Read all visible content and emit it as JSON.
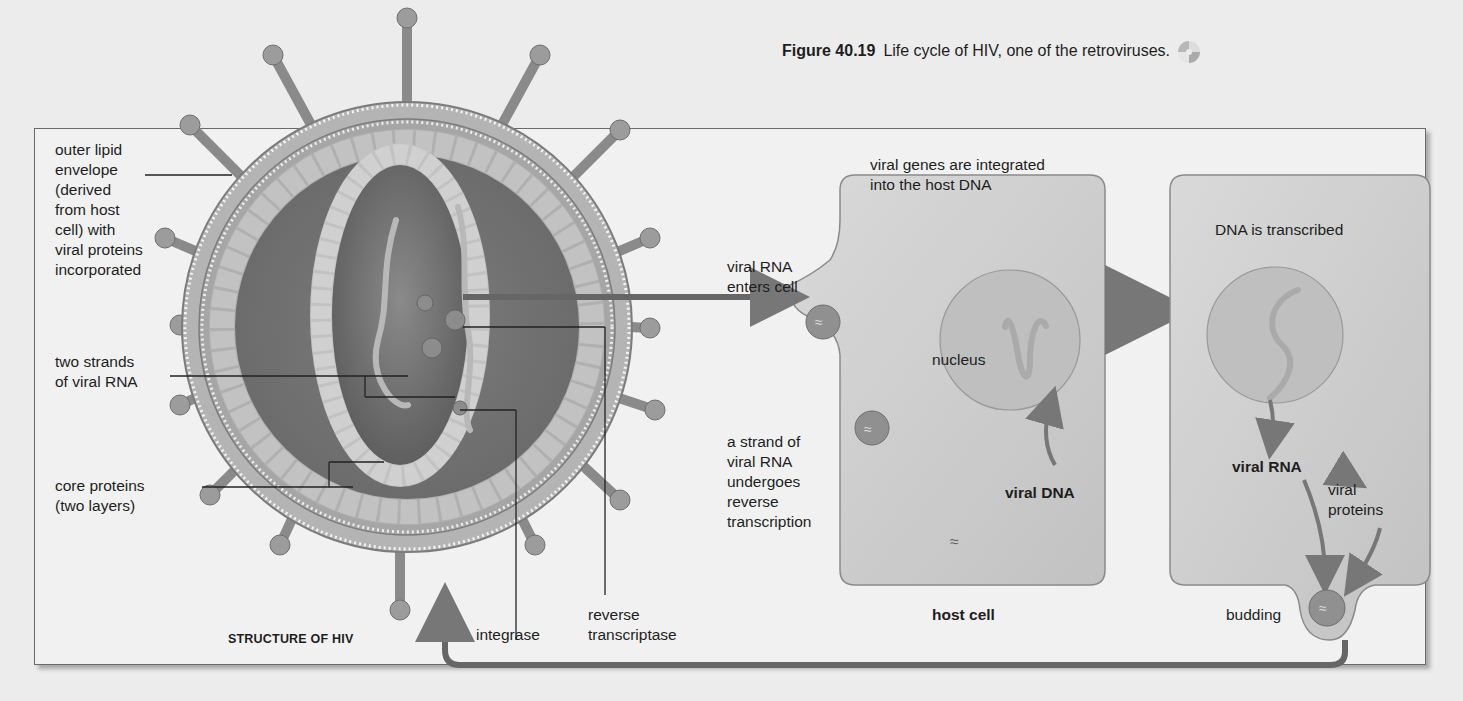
{
  "caption": {
    "figure_number": "Figure 40.19",
    "text": "Life cycle of HIV, one of the retroviruses.",
    "icon": "cd-disc-icon"
  },
  "structure": {
    "title": "STRUCTURE OF HIV",
    "labels": {
      "envelope": [
        "outer lipid",
        "envelope",
        "(derived",
        "from host",
        "cell) with",
        "viral proteins",
        "incorporated"
      ],
      "rna": [
        "two strands",
        "of viral RNA"
      ],
      "core": [
        "core proteins",
        "(two layers)"
      ],
      "integrase": "integrase",
      "rt": [
        "reverse",
        "transcriptase"
      ]
    }
  },
  "host_cell": {
    "title": "host cell",
    "enters": [
      "viral RNA",
      "enters cell"
    ],
    "integrated": [
      "viral genes are integrated",
      "into the host DNA"
    ],
    "nucleus": "nucleus",
    "reverse": [
      "a strand of",
      "viral RNA",
      "undergoes",
      "reverse",
      "transcription"
    ],
    "viral_dna": "viral DNA"
  },
  "second_cell": {
    "transcribed": "DNA is transcribed",
    "viral_rna": "viral RNA",
    "viral_proteins": [
      "viral",
      "proteins"
    ],
    "budding": "budding"
  },
  "colors": {
    "background": "#ececec",
    "panel": "#f1f1f1",
    "membrane": "#8e8e8e",
    "protein": "#a3a3a3",
    "core_dark": "#6a6a6a",
    "cell": "#cfcfcf",
    "nucleus": "#bdbdbd",
    "arrow": "#7a7a7a"
  }
}
